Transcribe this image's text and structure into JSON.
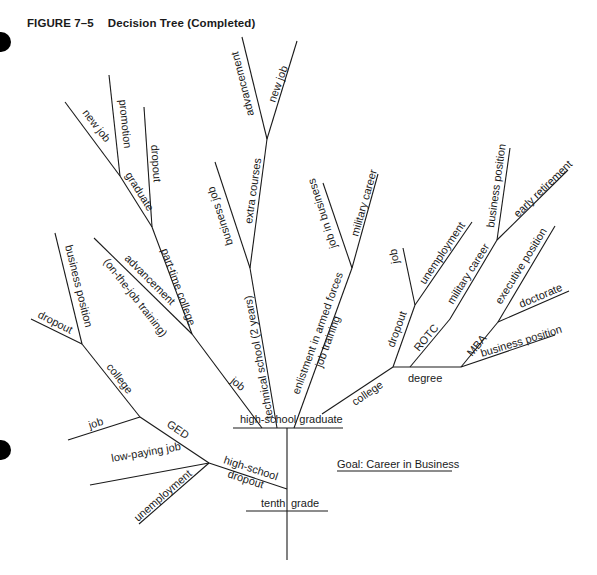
{
  "figure": {
    "number": "FIGURE 7–5",
    "title": "Decision Tree (Completed)",
    "goal": "Goal: Career in Business"
  },
  "nodes": {
    "root": "tenth grade",
    "root_left": "tenth",
    "root_right": "grade",
    "hs_graduate": "high-school graduate",
    "hs_dropout_1": "high-school",
    "hs_dropout_2": "dropout",
    "ged": "GED",
    "college_left": "college",
    "job_left": "job",
    "low_paying_job": "low-paying job",
    "unemployment_left": "unemployment",
    "dropout_left": "dropout",
    "business_position_left": "business position",
    "job_mid": "job",
    "advancement_ojt_1": "advancement",
    "advancement_ojt_2": "(on-the-job training)",
    "part_time_college": "part-time college",
    "graduate": "graduate",
    "dropout_ptc": "dropout",
    "new_job_grad": "new job",
    "promotion": "promotion",
    "technical_school": "technical school (2 years)",
    "business_job": "business job",
    "extra_courses": "extra courses",
    "advancement_top": "advancement",
    "new_job_top": "new job",
    "enlistment": "enlistment in armed forces",
    "job_training": "job training",
    "job_in_business": "job in business",
    "military_career_mid": "military career",
    "college_right": "college",
    "degree": "degree",
    "dropout_right": "dropout",
    "job_right": "job",
    "unemployment_right": "unemployment",
    "rotc": "ROTC",
    "military_career_right": "military career",
    "business_position_top": "business position",
    "early_retirement": "early retirement",
    "mba": "MBA",
    "executive_position": "executive position",
    "doctorate": "doctorate",
    "business_position_right": "business position"
  }
}
